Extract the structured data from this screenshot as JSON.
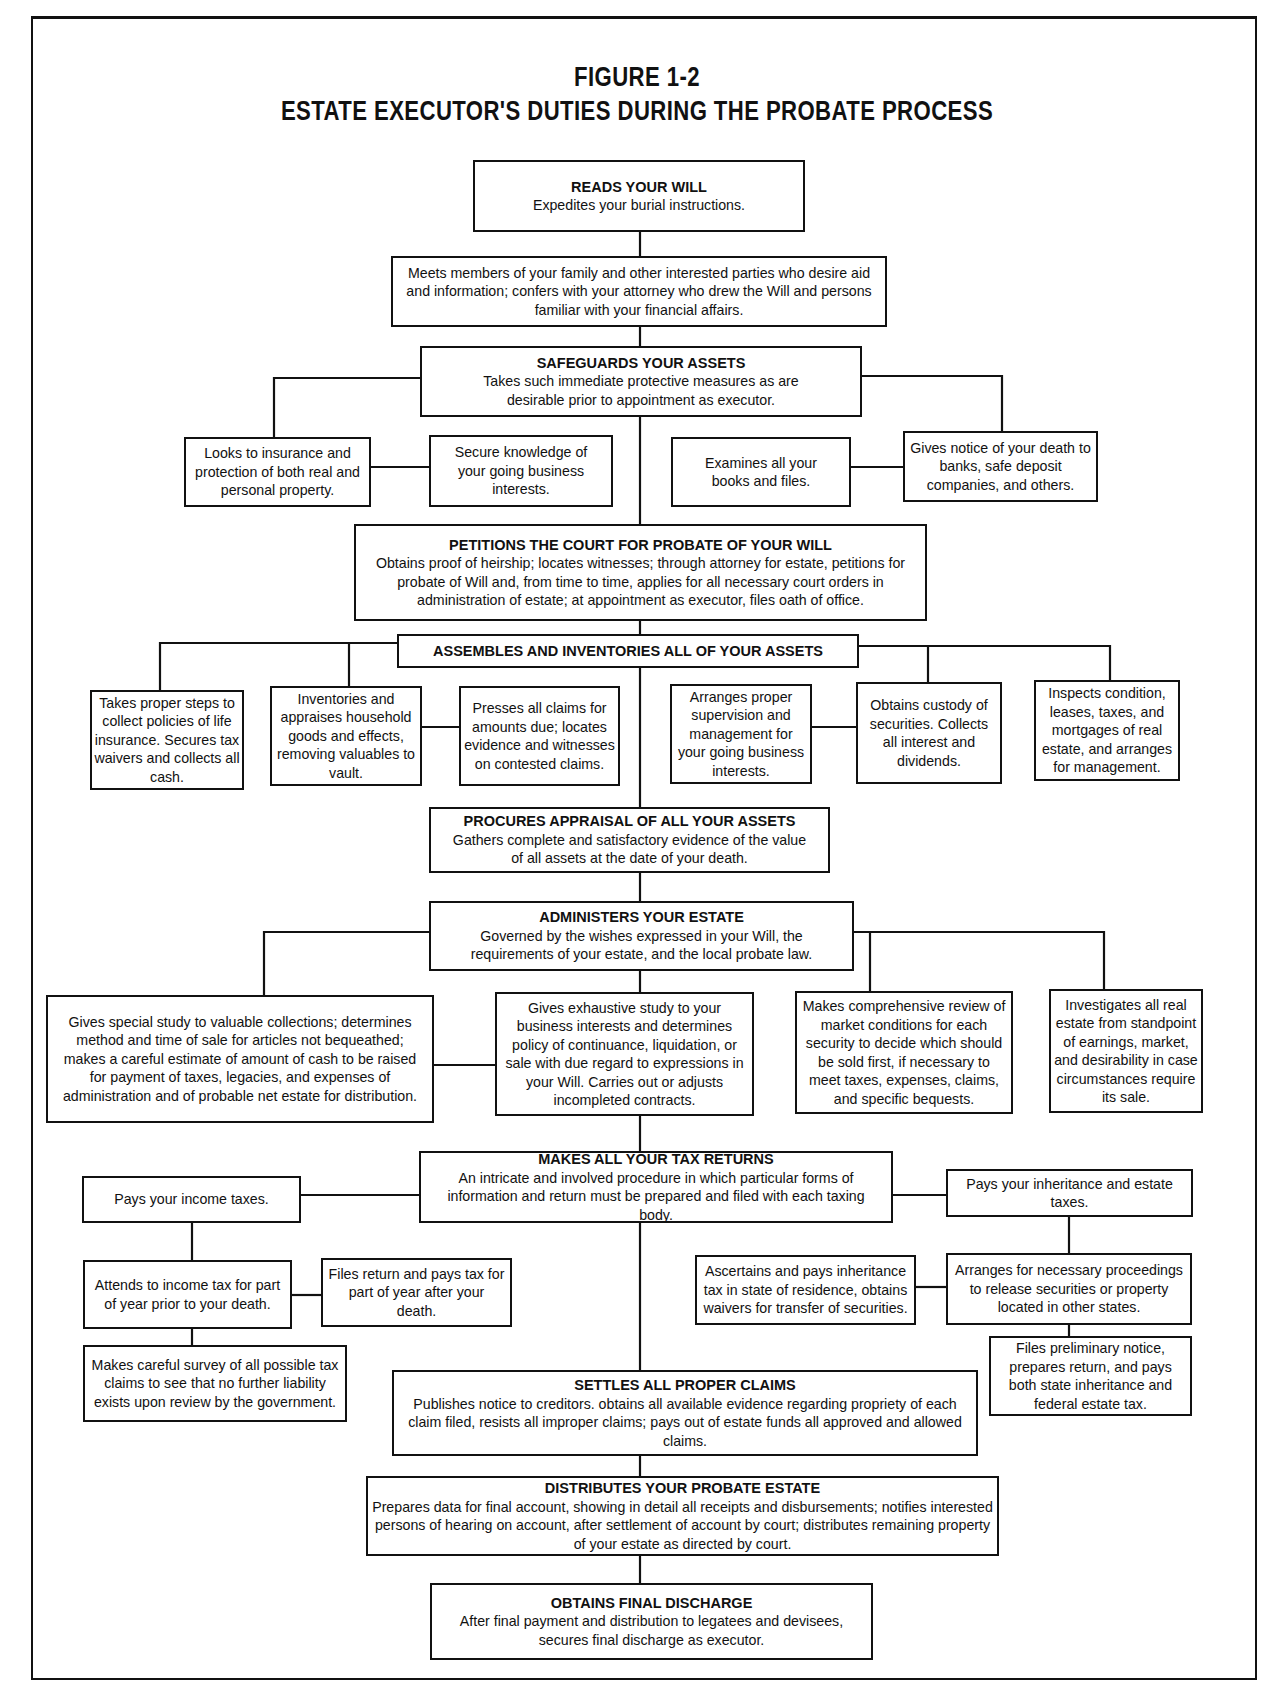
{
  "figure": {
    "label": "FIGURE 1-2",
    "title": "ESTATE EXECUTOR'S DUTIES DURING THE PROBATE PROCESS"
  },
  "nodes": {
    "reads_will": {
      "heading": "READS YOUR WILL",
      "text": "Expedites your burial instructions."
    },
    "meets_family": {
      "text": "Meets members of your family and other interested parties who desire aid and information; confers with your attorney who drew the Will and persons familiar with your financial affairs."
    },
    "safeguards": {
      "heading": "SAFEGUARDS YOUR ASSETS",
      "text": "Takes such immediate protective measures as are desirable prior to appointment as executor."
    },
    "insurance": {
      "text": "Looks to insurance and protection of both real and personal property."
    },
    "business_knowledge": {
      "text": "Secure knowledge of your going business interests."
    },
    "examines_books": {
      "text": "Examines all your books and files."
    },
    "gives_notice": {
      "text": "Gives notice of your death to banks, safe deposit companies, and others."
    },
    "petitions": {
      "heading": "PETITIONS THE COURT FOR PROBATE OF YOUR WILL",
      "text": "Obtains proof of heirship; locates witnesses; through attorney for estate, petitions for probate of Will and, from time to time, applies for all necessary court orders in administration of estate; at appointment as executor, files oath of office."
    },
    "assembles": {
      "heading": "ASSEMBLES AND INVENTORIES ALL OF YOUR ASSETS"
    },
    "life_insurance": {
      "text": "Takes proper steps to collect policies of life insurance. Secures tax waivers and collects all cash."
    },
    "household": {
      "text": "Inventories and appraises household goods and effects, removing valuables to vault."
    },
    "presses_claims": {
      "text": "Presses all claims for amounts due; locates evidence and witnesses on contested claims."
    },
    "supervision": {
      "text": "Arranges proper supervision and management for your going business interests."
    },
    "securities_custody": {
      "text": "Obtains custody of securities. Collects all interest and dividends."
    },
    "real_estate_inspect": {
      "text": "Inspects condition, leases, taxes, and mortgages of real estate, and arranges for management."
    },
    "appraisal": {
      "heading": "PROCURES APPRAISAL OF ALL YOUR ASSETS",
      "text": "Gathers complete and satisfactory evidence of the value of all assets at the date of your death."
    },
    "administers": {
      "heading": "ADMINISTERS YOUR ESTATE",
      "text": "Governed by the wishes expressed in your Will, the requirements of your estate, and the local probate law."
    },
    "collections": {
      "text": "Gives special study to valuable collections; determines method and time of sale for articles not bequeathed; makes a careful estimate of amount of cash to be raised for payment of taxes, legacies, and expenses of administration and of probable net estate for distribution."
    },
    "business_study": {
      "text": "Gives exhaustive study to your business interests and determines policy of continuance, liquidation, or sale with due regard to expressions in your Will. Carries out or adjusts incompleted contracts."
    },
    "market_review": {
      "text": "Makes comprehensive review of market conditions for each security to decide which should be sold first, if necessary to meet taxes, expenses, claims, and specific bequests."
    },
    "real_estate_investigate": {
      "text": "Investigates all real estate from standpoint of earnings, market, and desirability in case circumstances require its sale."
    },
    "tax_returns": {
      "heading": "MAKES ALL YOUR TAX RETURNS",
      "text": "An intricate and involved procedure in which particular forms of information and return must be prepared and filed with each taxing body."
    },
    "income_taxes": {
      "text": "Pays your income taxes."
    },
    "income_prior": {
      "text": "Attends to income tax for part of year prior to your death."
    },
    "income_after": {
      "text": "Files return and pays tax for part of year after your death."
    },
    "tax_survey": {
      "text": "Makes careful survey of all possible tax claims to see that no further liability exists upon review by the government."
    },
    "inheritance_taxes": {
      "text": "Pays your inheritance and estate taxes."
    },
    "inheritance_state": {
      "text": "Ascertains and pays inheritance tax in state of residence, obtains waivers for transfer of securities."
    },
    "other_states": {
      "text": "Arranges for necessary proceedings to release securities or property located in other states."
    },
    "preliminary_notice": {
      "text": "Files preliminary notice, prepares return, and pays both state inheritance and federal estate tax."
    },
    "settles_claims": {
      "heading": "SETTLES ALL PROPER CLAIMS",
      "text": "Publishes notice to creditors. obtains all available evidence regarding propriety of each claim filed, resists all improper claims; pays out of estate funds all approved and allowed claims."
    },
    "distributes": {
      "heading": "DISTRIBUTES YOUR PROBATE ESTATE",
      "text": "Prepares data for final account, showing in detail all receipts and disbursements; notifies interested persons of hearing on account, after settlement of account by court; distributes remaining property of your estate as directed by court."
    },
    "final_discharge": {
      "heading": "OBTAINS FINAL DISCHARGE",
      "text": "After final payment and distribution to legatees and devisees, secures final discharge as executor."
    }
  }
}
